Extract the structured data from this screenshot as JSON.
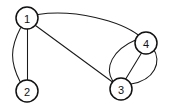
{
  "figure": {
    "type": "undirected-multigraph",
    "background_color": "#ffffff",
    "stroke_color": "#1a1a1a",
    "node_fill_color": "#ffffff",
    "node_stroke_color": "#111111",
    "node_radius": 11,
    "width": 169,
    "height": 111
  },
  "nodes": [
    {
      "id": "1",
      "label": "1",
      "cx": 27,
      "cy": 18
    },
    {
      "id": "2",
      "label": "2",
      "cx": 27,
      "cy": 91
    },
    {
      "id": "3",
      "label": "3",
      "cx": 121,
      "cy": 89
    },
    {
      "id": "4",
      "label": "4",
      "cx": 146,
      "cy": 43
    }
  ],
  "edges": [
    {
      "source": "1",
      "target": "2",
      "shape": "arc-left",
      "path": "M 20.5 28.0 C 10.0 48.0 10.0 62.0 20.0 81.5"
    },
    {
      "source": "1",
      "target": "2",
      "shape": "straight",
      "path": "M 27.5 29.0 L 27.5 80.0"
    },
    {
      "source": "1",
      "target": "3",
      "shape": "straight",
      "path": "M 35.5 25.5 L 112.5 82.0"
    },
    {
      "source": "1",
      "target": "4",
      "shape": "arc-up",
      "path": "M 38.0 14.5 C 75.0 9.0 120.0 21.0 139.0 35.5"
    },
    {
      "source": "3",
      "target": "4",
      "shape": "arc-left",
      "path": "M 113.0 81.5 C 104.0 68.0 112.0 50.0 136.5 39.5"
    },
    {
      "source": "3",
      "target": "4",
      "shape": "straight",
      "path": "M 126.0 78.5 L 141.5 53.0"
    },
    {
      "source": "3",
      "target": "4",
      "shape": "arc-right",
      "path": "M 131.0 84.0 C 155.0 80.0 162.0 62.0 153.0 48.0"
    }
  ],
  "edge_multiplicities": [
    {
      "pair": "1-2",
      "count": 2
    },
    {
      "pair": "1-3",
      "count": 1
    },
    {
      "pair": "1-4",
      "count": 1
    },
    {
      "pair": "3-4",
      "count": 3
    }
  ]
}
